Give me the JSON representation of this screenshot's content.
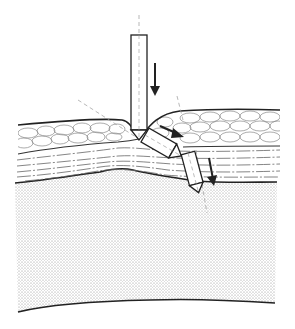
{
  "diagram": {
    "colors": {
      "background": "#ffffff",
      "stroke": "#222222",
      "thin_stroke": "#555555",
      "dashed": "#888888",
      "stipple": "#9a9a9a"
    },
    "layers": [
      {
        "name": "upper-cellular-layer",
        "pattern": "cobblestone"
      },
      {
        "name": "fibrous-layer",
        "pattern": "dash-dot-lines"
      },
      {
        "name": "deep-stippled-layer",
        "pattern": "stipple"
      }
    ],
    "instruments": [
      {
        "name": "vertical-instrument",
        "angle_deg": 0,
        "arrow": "down"
      },
      {
        "name": "angled-instrument",
        "angle_deg": -60,
        "arrow": "down-right"
      },
      {
        "name": "deep-instrument",
        "angle_deg": -15,
        "arrow": "down"
      }
    ]
  }
}
